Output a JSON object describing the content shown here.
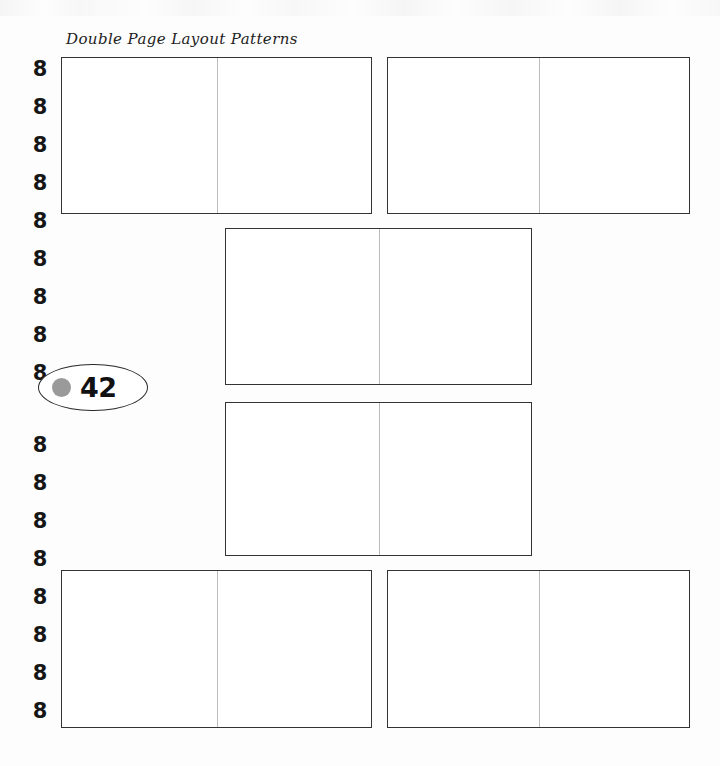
{
  "page": {
    "title": "Double Page Layout Patterns",
    "number": "42",
    "background_color": "#fdfdfd",
    "border_color": "#333333",
    "gutter_color": "#bcbcbc",
    "badge_dot_color": "#9a9a9a"
  },
  "binding": {
    "ring_glyph": "8",
    "ring_count_above_badge": 9,
    "ring_count_below_badge": 8,
    "rings_above": [
      {
        "glyph": "8",
        "top": 56
      },
      {
        "glyph": "8",
        "top": 94
      },
      {
        "glyph": "8",
        "top": 132
      },
      {
        "glyph": "8",
        "top": 170
      },
      {
        "glyph": "8",
        "top": 208
      },
      {
        "glyph": "8",
        "top": 246
      },
      {
        "glyph": "8",
        "top": 284
      },
      {
        "glyph": "8",
        "top": 322
      },
      {
        "glyph": "8",
        "top": 360
      }
    ],
    "rings_below": [
      {
        "glyph": "8",
        "top": 432
      },
      {
        "glyph": "8",
        "top": 470
      },
      {
        "glyph": "8",
        "top": 508
      },
      {
        "glyph": "8",
        "top": 546
      },
      {
        "glyph": "8",
        "top": 584
      },
      {
        "glyph": "8",
        "top": 622
      },
      {
        "glyph": "8",
        "top": 660
      },
      {
        "glyph": "8",
        "top": 698
      }
    ]
  },
  "spreads": [
    {
      "name": "spread-1",
      "row": 1,
      "side": "left",
      "left": 61,
      "top": 57,
      "width": 311,
      "height": 157
    },
    {
      "name": "spread-2",
      "row": 1,
      "side": "right",
      "left": 387,
      "top": 57,
      "width": 303,
      "height": 157
    },
    {
      "name": "spread-3",
      "row": 2,
      "side": "center",
      "left": 225,
      "top": 228,
      "width": 307,
      "height": 157
    },
    {
      "name": "spread-4",
      "row": 3,
      "side": "center",
      "left": 225,
      "top": 402,
      "width": 307,
      "height": 154
    },
    {
      "name": "spread-5",
      "row": 4,
      "side": "left",
      "left": 61,
      "top": 570,
      "width": 311,
      "height": 158
    },
    {
      "name": "spread-6",
      "row": 4,
      "side": "right",
      "left": 387,
      "top": 570,
      "width": 303,
      "height": 158
    }
  ]
}
